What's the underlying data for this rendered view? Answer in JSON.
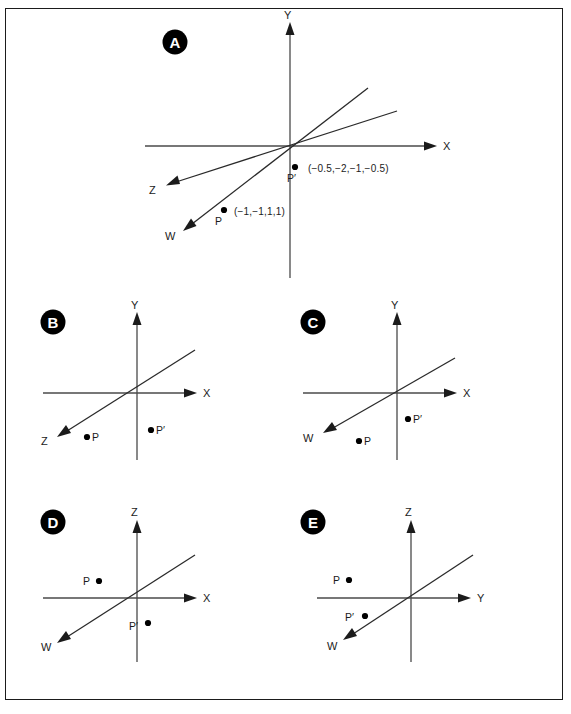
{
  "figure": {
    "background_color": "#ffffff",
    "border_color": "#1b1b1b",
    "axis_color": "#4a4a4a",
    "line_color": "#2a2a2a",
    "dot_color": "#000000",
    "badge_fill": "#000000",
    "badge_text_color": "#ffffff"
  },
  "panels": [
    {
      "id": "A",
      "badge": "A",
      "axes": [
        {
          "name": "Y",
          "label": "Y"
        },
        {
          "name": "X",
          "label": "X"
        },
        {
          "name": "Z",
          "label": "Z"
        },
        {
          "name": "W",
          "label": "W"
        }
      ],
      "points": [
        {
          "name": "P",
          "label": "P",
          "coords": "(−1,−1,1,1)"
        },
        {
          "name": "P-prime",
          "label": "P′",
          "coords": "(−0.5,−2,−1,−0.5)"
        }
      ]
    },
    {
      "id": "B",
      "badge": "B",
      "axes": [
        {
          "name": "Y",
          "label": "Y"
        },
        {
          "name": "X",
          "label": "X"
        },
        {
          "name": "Z",
          "label": "Z"
        }
      ],
      "points": [
        {
          "name": "P",
          "label": "P",
          "coords": ""
        },
        {
          "name": "P-prime",
          "label": "P′",
          "coords": ""
        }
      ]
    },
    {
      "id": "C",
      "badge": "C",
      "axes": [
        {
          "name": "Y",
          "label": "Y"
        },
        {
          "name": "X",
          "label": "X"
        },
        {
          "name": "W",
          "label": "W"
        }
      ],
      "points": [
        {
          "name": "P",
          "label": "P",
          "coords": ""
        },
        {
          "name": "P-prime",
          "label": "P′",
          "coords": ""
        }
      ]
    },
    {
      "id": "D",
      "badge": "D",
      "axes": [
        {
          "name": "Z",
          "label": "Z"
        },
        {
          "name": "X",
          "label": "X"
        },
        {
          "name": "W",
          "label": "W"
        }
      ],
      "points": [
        {
          "name": "P",
          "label": "P",
          "coords": ""
        },
        {
          "name": "P-prime",
          "label": "P′",
          "coords": ""
        }
      ]
    },
    {
      "id": "E",
      "badge": "E",
      "axes": [
        {
          "name": "Z",
          "label": "Z"
        },
        {
          "name": "Y",
          "label": "Y"
        },
        {
          "name": "W",
          "label": "W"
        }
      ],
      "points": [
        {
          "name": "P",
          "label": "P",
          "coords": ""
        },
        {
          "name": "P-prime",
          "label": "P′",
          "coords": ""
        }
      ]
    }
  ]
}
